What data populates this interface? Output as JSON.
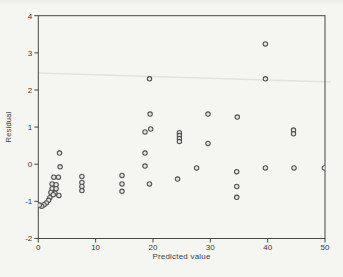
{
  "figure": {
    "kind": "scanned-statistical-figure",
    "background_color": "#f5f5f2",
    "axis_color": "#474747",
    "tick_label_color": "#383838",
    "marker_stroke_color": "#525252",
    "marker_fill_color": "#e8e6e2"
  },
  "chart_data": {
    "type": "scatter",
    "title": "",
    "xlabel": "Predicted value",
    "ylabel": "Residual",
    "xlim": [
      0,
      50
    ],
    "ylim": [
      -2,
      4
    ],
    "x_ticks": [
      0,
      10,
      20,
      30,
      40,
      50
    ],
    "y_ticks": [
      4,
      3,
      2,
      1,
      0,
      -1,
      -2
    ],
    "grid": false,
    "legend": null,
    "marker": "open-circle",
    "points": [
      [
        39.6,
        3.24
      ],
      [
        19.4,
        2.3
      ],
      [
        39.6,
        2.3
      ],
      [
        19.5,
        1.35
      ],
      [
        29.6,
        1.35
      ],
      [
        34.7,
        1.27
      ],
      [
        18.6,
        0.87
      ],
      [
        19.6,
        0.95
      ],
      [
        44.5,
        0.92
      ],
      [
        44.5,
        0.82
      ],
      [
        24.6,
        0.85
      ],
      [
        24.6,
        0.77
      ],
      [
        24.6,
        0.69
      ],
      [
        24.6,
        0.61
      ],
      [
        29.6,
        0.56
      ],
      [
        18.6,
        0.3
      ],
      [
        3.7,
        0.3
      ],
      [
        18.6,
        -0.05
      ],
      [
        3.8,
        -0.07
      ],
      [
        27.6,
        -0.1
      ],
      [
        39.6,
        -0.1
      ],
      [
        44.6,
        -0.1
      ],
      [
        49.9,
        -0.1
      ],
      [
        2.7,
        -0.35
      ],
      [
        3.5,
        -0.35
      ],
      [
        7.6,
        -0.33
      ],
      [
        7.6,
        -0.49
      ],
      [
        7.6,
        -0.6
      ],
      [
        7.6,
        -0.71
      ],
      [
        14.6,
        -0.3
      ],
      [
        14.6,
        -0.53
      ],
      [
        14.6,
        -0.73
      ],
      [
        19.4,
        -0.53
      ],
      [
        24.3,
        -0.4
      ],
      [
        34.6,
        -0.2
      ],
      [
        34.6,
        -0.6
      ],
      [
        34.6,
        -0.89
      ],
      [
        2.4,
        -0.53
      ],
      [
        3.1,
        -0.55
      ],
      [
        2.4,
        -0.66
      ],
      [
        3.1,
        -0.66
      ],
      [
        2.2,
        -0.76
      ],
      [
        2.9,
        -0.78
      ],
      [
        2.6,
        -0.82
      ],
      [
        3.6,
        -0.84
      ],
      [
        2.0,
        -0.9
      ],
      [
        1.8,
        -0.97
      ],
      [
        1.4,
        -1.04
      ],
      [
        1.0,
        -1.09
      ],
      [
        0.6,
        -1.13
      ],
      [
        0.2,
        -1.1
      ]
    ]
  }
}
